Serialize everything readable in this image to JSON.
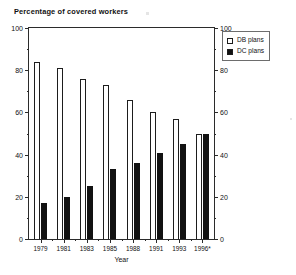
{
  "chart_data": {
    "type": "bar",
    "title": "Percentage of covered workers",
    "xlabel": "Year",
    "ylabel": "",
    "categories": [
      "1979",
      "1981",
      "1983",
      "1985",
      "1988",
      "1991",
      "1993",
      "1996*"
    ],
    "series": [
      {
        "name": "DB plans",
        "color": "#ffffff",
        "values": [
          84,
          81,
          76,
          73,
          66,
          60,
          57,
          50
        ]
      },
      {
        "name": "DC plans",
        "color": "#121212",
        "values": [
          17,
          20,
          25,
          33,
          36,
          41,
          45,
          50
        ]
      }
    ],
    "ylim": [
      0,
      100
    ],
    "y_ticks": [
      0,
      20,
      40,
      60,
      80,
      100
    ],
    "y_minor_ticks": [
      10,
      30,
      50,
      70,
      90
    ],
    "y_tick_labels_left": [
      "0",
      "20",
      "40",
      "60",
      "80",
      "100"
    ],
    "y_tick_labels_right": [
      "0",
      "20",
      "40",
      "60",
      "80",
      "100"
    ],
    "dual_axis": true,
    "grid": false,
    "legend_position": "top-right-outside",
    "footnote_marker": "*"
  },
  "legend": {
    "entries": [
      {
        "label": "DB plans",
        "swatch": "open-square-swatch"
      },
      {
        "label": "DC plans",
        "swatch": "filled-square-swatch"
      }
    ]
  },
  "axes": {
    "title": "Percentage of covered workers",
    "x_axis_name": "Year"
  }
}
